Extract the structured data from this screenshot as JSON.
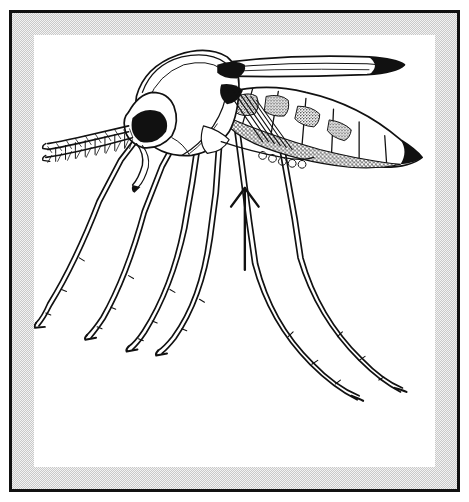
{
  "figure": {
    "kind": "scientific-line-drawing",
    "view": "lateral",
    "caption": "",
    "frame": {
      "outline_color": "#111111",
      "mat_color": "#c9c9c9",
      "window_color": "#ffffff"
    },
    "ink_color": "#111111",
    "annotation": {
      "type": "arrow",
      "direction": "up",
      "label": "",
      "points_to": "mid-ventral thorax / leg base"
    },
    "parts": [
      {
        "name": "proboscis",
        "label": ""
      },
      {
        "name": "antenna",
        "label": ""
      },
      {
        "name": "compound-eye",
        "label": ""
      },
      {
        "name": "head",
        "label": ""
      },
      {
        "name": "thorax",
        "label": ""
      },
      {
        "name": "wing",
        "label": ""
      },
      {
        "name": "abdomen",
        "label": ""
      },
      {
        "name": "foreleg",
        "label": ""
      },
      {
        "name": "midleg",
        "label": ""
      },
      {
        "name": "hindleg",
        "label": ""
      }
    ]
  }
}
